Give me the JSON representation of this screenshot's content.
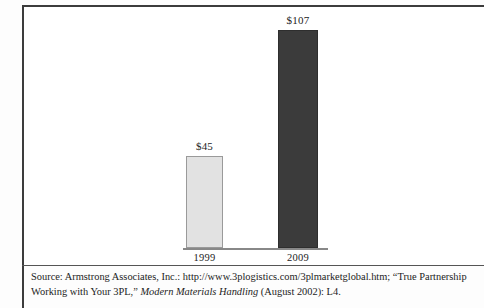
{
  "chart_data": {
    "type": "bar",
    "title": "",
    "subtitle": "",
    "xlabel": "",
    "ylabel": "",
    "categories": [
      "1999",
      "2009"
    ],
    "values": [
      45,
      107
    ],
    "value_labels": [
      "$45",
      "$107"
    ],
    "units": "$ billions",
    "ylim": [
      0,
      107
    ],
    "grid": false,
    "legend": "none",
    "axis": {
      "baseline_visible": true,
      "y_axis_visible": false,
      "tick_labels_visible": false
    },
    "series": [
      {
        "name": "3PL market size",
        "values": [
          45,
          107
        ],
        "labels": [
          "$45",
          "$107"
        ],
        "colors": [
          "#e2e2e2",
          "#3b3b3b"
        ]
      }
    ],
    "bars": [
      {
        "category": "1999",
        "value": 45,
        "label": "$45",
        "fill": "#e2e2e2",
        "stroke": "#9a9a9a"
      },
      {
        "category": "2009",
        "value": 107,
        "label": "$107",
        "fill": "#3b3b3b",
        "stroke": "#2e2e2e"
      }
    ]
  },
  "figure": {
    "frame_color": "#3c3c3c",
    "divider_color": "#555555",
    "axis_color": "#888888",
    "background": "#ffffff"
  },
  "source": {
    "line1": "Source: Armstrong Associates, Inc.: http://www.3plogistics.com/3plmarketglobal.htm; “True Partnership",
    "line2_prefix": "Working with Your 3PL,” ",
    "line2_italic": "Modern Materials Handling",
    "line2_suffix": " (August 2002): L4."
  }
}
